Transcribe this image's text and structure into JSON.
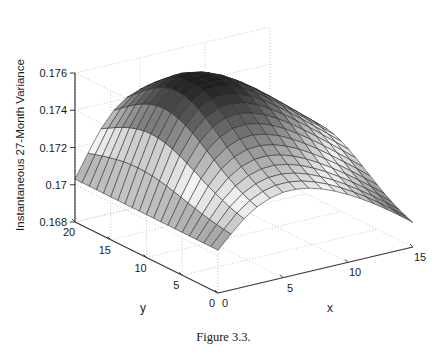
{
  "figure": {
    "caption": "Figure 3.3.",
    "caption_y": 330
  },
  "chart_data": {
    "type": "surface",
    "title": "",
    "xlabel": "x",
    "ylabel": "y",
    "zlabel": "Instantaneous 27-Month Variance",
    "grid": true,
    "legend": "none",
    "colormap": "gray",
    "xlim": [
      0,
      15
    ],
    "ylim": [
      0,
      20
    ],
    "zlim": [
      0.168,
      0.176
    ],
    "xticks": [
      0,
      5,
      10,
      15
    ],
    "xticklabels": [
      "0",
      "5",
      "10",
      "15"
    ],
    "yticks": [
      0,
      5,
      10,
      15,
      20
    ],
    "yticklabels": [
      "0",
      "5",
      "10",
      "15",
      "20"
    ],
    "zticks": [
      0.168,
      0.17,
      0.172,
      0.174,
      0.176
    ],
    "zticklabels": [
      "0.168",
      "0.17",
      "0.172",
      "0.174",
      "0.176"
    ],
    "nx": 16,
    "ny": 21,
    "view": {
      "azimuth": -37.5,
      "elevation": 22
    },
    "surface_model": {
      "description": "Instantaneous variance ridge: rises from 0.1705 plateau at far y, crests near 0.176 then decays toward 0.1685 at x=15,y=0 corner.",
      "base": 0.1703,
      "peak": 0.1762,
      "trough": 0.1685,
      "ridge_x": 6.0,
      "ridge_y": 13.0
    },
    "z_samples": {
      "note": "z values on a coarse 4x5 grid (x = 0,5,10,15 across; y = 0,5,10,15,20 rows)",
      "x": [
        0,
        5,
        10,
        15
      ],
      "y": [
        0,
        5,
        10,
        15,
        20
      ],
      "z": [
        [
          0.1703,
          0.1718,
          0.1706,
          0.1685
        ],
        [
          0.1703,
          0.1736,
          0.1722,
          0.1697
        ],
        [
          0.1704,
          0.1755,
          0.174,
          0.1712
        ],
        [
          0.1704,
          0.176,
          0.1748,
          0.1722
        ],
        [
          0.1703,
          0.1742,
          0.1736,
          0.1718
        ]
      ]
    }
  },
  "axes": {
    "z_axis_name": "z-axis",
    "x_axis_name": "x-axis",
    "y_axis_name": "y-axis"
  },
  "colors": {
    "background": "#ffffff",
    "axis_line": "#3a3a3a",
    "grid_dot": "#b9b9b9",
    "mesh_line": "#2a2a2a",
    "text": "#1b1b1b",
    "surface_light": "#f2f2f2",
    "surface_dark": "#1e1e1e"
  }
}
